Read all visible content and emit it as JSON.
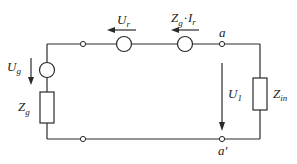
{
  "diagram": {
    "type": "circuit",
    "colors": {
      "line": "#2a2a2a",
      "background": "#ffffff"
    },
    "labels": {
      "source_voltage": {
        "main": "U",
        "sub": "g"
      },
      "source_impedance": {
        "main": "Z",
        "sub": "g"
      },
      "reflected_voltage": {
        "main": "U",
        "sub": "r"
      },
      "reflected_source": {
        "main": "Z",
        "sub1": "g",
        "dot": "·",
        "main2": "I",
        "sub2": "r"
      },
      "node_top": "a",
      "node_bottom": "a'",
      "load_voltage": {
        "main": "U",
        "sub": "1"
      },
      "load_impedance": {
        "main": "Z",
        "sub": "in"
      }
    }
  }
}
